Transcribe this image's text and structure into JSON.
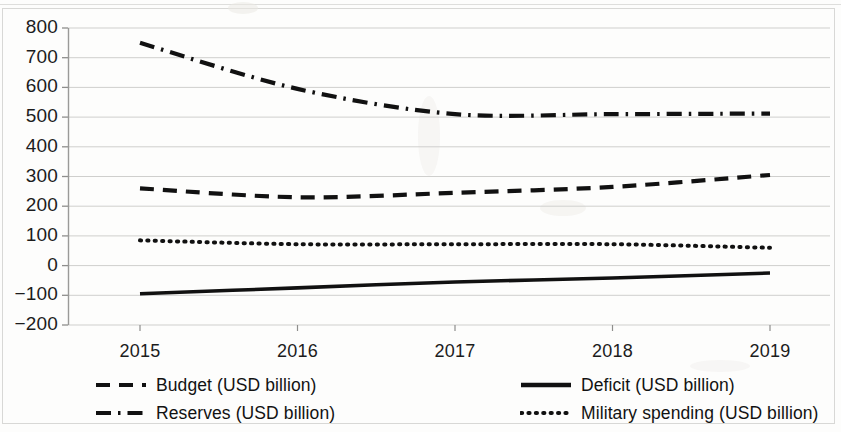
{
  "chart_data": {
    "type": "line",
    "title": "",
    "subtitle": "",
    "xlabel": "",
    "ylabel": "",
    "x": [
      2015,
      2016,
      2017,
      2018,
      2019
    ],
    "categories": [
      "2015",
      "2016",
      "2017",
      "2018",
      "2019"
    ],
    "xtick_labels": [
      "2015",
      "2016",
      "2017",
      "2018",
      "2019"
    ],
    "ytick_labels": [
      "800",
      "700",
      "600",
      "500",
      "400",
      "300",
      "200",
      "100",
      "0",
      "−100",
      "−200"
    ],
    "ytick_values": [
      800,
      700,
      600,
      500,
      400,
      300,
      200,
      100,
      0,
      -100,
      -200
    ],
    "ylim": [
      -200,
      800
    ],
    "xlim": [
      2015,
      2019
    ],
    "grid": "horizontal",
    "legend_position": "bottom",
    "series": [
      {
        "name": "Budget (USD billion)",
        "style": "dashed",
        "color": "#111111",
        "values": [
          260,
          230,
          245,
          265,
          305
        ]
      },
      {
        "name": "Deficit (USD billion)",
        "style": "solid",
        "color": "#111111",
        "values": [
          -95,
          -75,
          -55,
          -42,
          -25
        ]
      },
      {
        "name": "Reserves (USD billion)",
        "style": "dashdot",
        "color": "#111111",
        "values": [
          750,
          595,
          510,
          510,
          512
        ]
      },
      {
        "name": "Military spending (USD billion)",
        "style": "dotted",
        "color": "#111111",
        "values": [
          85,
          72,
          72,
          72,
          60
        ]
      }
    ]
  },
  "legend": {
    "items": [
      {
        "label": "Budget (USD billion)",
        "style": "dashed"
      },
      {
        "label": "Deficit (USD billion)",
        "style": "solid"
      },
      {
        "label": "Reserves (USD billion)",
        "style": "dashdot"
      },
      {
        "label": "Military spending (USD billion)",
        "style": "dotted"
      }
    ]
  }
}
